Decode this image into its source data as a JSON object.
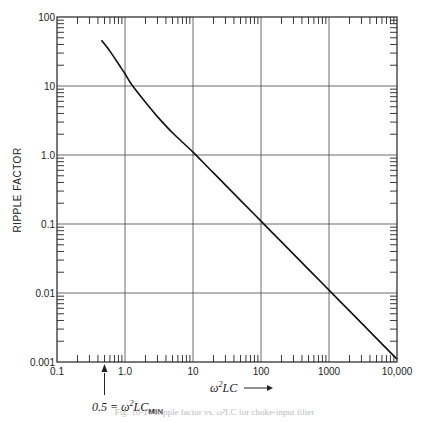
{
  "chart_data": {
    "type": "line",
    "title": "",
    "xlabel": "ω²LC →",
    "ylabel": "RIPPLE FACTOR",
    "xscale": "log",
    "yscale": "log",
    "xlim": [
      0.1,
      10000
    ],
    "ylim": [
      0.001,
      100
    ],
    "grid": true,
    "x_tick_labels": [
      "0.1",
      "1.0",
      "10",
      "100",
      "1000",
      "10,000"
    ],
    "y_tick_labels": [
      "0.001",
      "0.01",
      "0.1",
      "1.0",
      "10",
      "100"
    ],
    "series": [
      {
        "name": "Ripple factor",
        "x": [
          0.45,
          0.6,
          0.8,
          1.0,
          1.3,
          2,
          3,
          5,
          10,
          20,
          50,
          100,
          200,
          500,
          1000,
          2000,
          5000,
          10000
        ],
        "y": [
          46,
          32,
          21,
          15,
          10,
          5.8,
          3.6,
          2.1,
          1.1,
          0.55,
          0.22,
          0.11,
          0.055,
          0.022,
          0.011,
          0.0055,
          0.0022,
          0.0011
        ]
      }
    ],
    "annotations": [
      {
        "text_main": "0.5 = ω²LC",
        "text_sub": "MIN",
        "points_to_x": 0.5
      }
    ]
  },
  "caption": "Fig. 10-10  Ripple factor vs. ω²LC for choke-input filter"
}
